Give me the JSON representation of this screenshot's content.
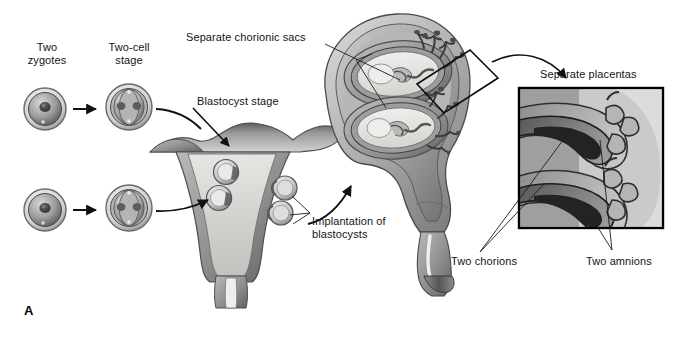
{
  "figure": {
    "panel_letter": "A",
    "background_color": "#ffffff",
    "width": 679,
    "height": 347
  },
  "labels": [
    {
      "id": "two-zygotes",
      "text": "Two\nzygotes",
      "x": 47,
      "y": 41,
      "align": "center"
    },
    {
      "id": "two-cell-stage",
      "text": "Two-cell\nstage",
      "x": 128,
      "y": 41,
      "align": "center"
    },
    {
      "id": "separate-chorionic-sacs",
      "text": "Separate chorionic sacs",
      "x": 186,
      "y": 31,
      "align": "left"
    },
    {
      "id": "blastocyst-stage",
      "text": "Blastocyst stage",
      "x": 197,
      "y": 95,
      "align": "left"
    },
    {
      "id": "implantation-of-blastocysts",
      "text": "Implantation of\nblastocysts",
      "x": 312,
      "y": 215,
      "align": "left"
    },
    {
      "id": "separate-placentas",
      "text": "Separate placentas",
      "x": 540,
      "y": 68,
      "align": "left"
    },
    {
      "id": "two-chorions",
      "text": "Two chorions",
      "x": 451,
      "y": 255,
      "align": "left"
    },
    {
      "id": "two-amnions",
      "text": "Two amnions",
      "x": 586,
      "y": 255,
      "align": "left"
    }
  ],
  "colors": {
    "ink": "#141414",
    "leader_line": "#1c1c1c",
    "arrow": "#111111",
    "tissue_light": "#cfcfcf",
    "tissue_mid": "#a8a8a8",
    "tissue_dark": "#6e6e6e",
    "cavity": "#f0efed",
    "dark_fill": "#2a2a2a",
    "inset_border": "#000000"
  },
  "structures": [
    {
      "name": "zygote-top",
      "stage": "zygote",
      "row": "top"
    },
    {
      "name": "two-cell-top",
      "stage": "two-cell",
      "row": "top"
    },
    {
      "name": "zygote-bottom",
      "stage": "zygote",
      "row": "bottom"
    },
    {
      "name": "two-cell-bottom",
      "stage": "two-cell",
      "row": "bottom"
    },
    {
      "name": "uterus-frontal-section",
      "stage": "implantation",
      "blastocysts": 4
    },
    {
      "name": "pregnant-uterus",
      "stage": "twin-gestation",
      "fetuses": 2,
      "sacs": 2
    },
    {
      "name": "magnification-inset",
      "stage": "placental-detail",
      "chorions": 2,
      "amnions": 2
    }
  ]
}
